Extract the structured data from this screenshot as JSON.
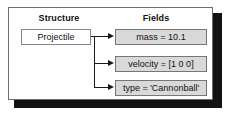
{
  "figure": {
    "columns": {
      "structure_heading": "Structure",
      "fields_heading": "Fields"
    },
    "structure_node": {
      "label": "Projectile"
    },
    "fields": [
      {
        "label": "mass = 10.1"
      },
      {
        "label": "velocity = [1 0 0]"
      },
      {
        "label": "type = 'Cannonball'"
      }
    ],
    "colors": {
      "frame_border": "#6e6e6e",
      "shadow": "#121212",
      "field_fill": "#d9d9d9",
      "field_border": "#767676",
      "struct_fill": "#ffffff",
      "struct_border": "#888888",
      "connector": "#1a1a1a",
      "text": "#111111",
      "background": "#ffffff"
    }
  }
}
